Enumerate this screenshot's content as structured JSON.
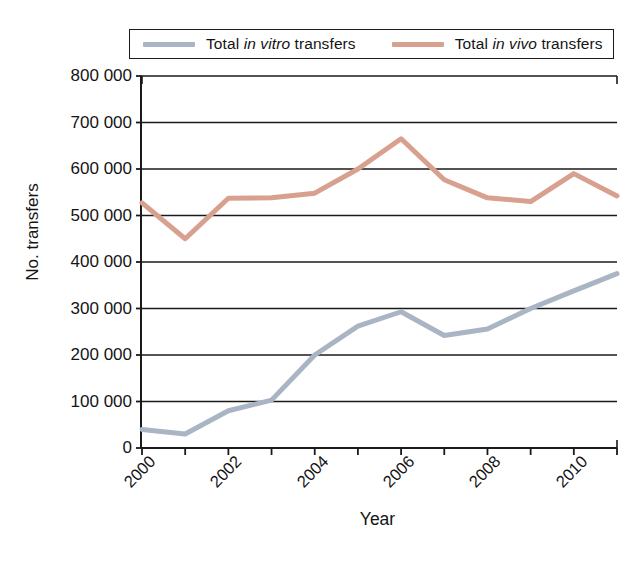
{
  "chart_data": {
    "type": "line",
    "title": "",
    "xlabel": "Year",
    "ylabel": "No. transfers",
    "x": [
      2000,
      2001,
      2002,
      2003,
      2004,
      2005,
      2006,
      2007,
      2008,
      2009,
      2010,
      2011
    ],
    "categories": [
      "2000",
      "2001",
      "2002",
      "2003",
      "2004",
      "2005",
      "2006",
      "2007",
      "2008",
      "2009",
      "2010",
      "2011"
    ],
    "series": [
      {
        "name": "Total in vitro transfers",
        "color": "#a9b5c4",
        "values": [
          40000,
          30000,
          80000,
          103000,
          200000,
          262000,
          293000,
          242000,
          256000,
          300000,
          338000,
          375000
        ]
      },
      {
        "name": "Total in vivo transfers",
        "color": "#d8a08e",
        "values": [
          527000,
          450000,
          537000,
          538000,
          548000,
          600000,
          665000,
          577000,
          538000,
          530000,
          590000,
          542000
        ]
      }
    ],
    "ylim": [
      0,
      800000
    ],
    "xlim": [
      2000,
      2011
    ],
    "ytick_values": [
      0,
      100000,
      200000,
      300000,
      400000,
      500000,
      600000,
      700000,
      800000
    ],
    "ytick_labels": [
      "0",
      "100 000",
      "200 000",
      "300 000",
      "400 000",
      "500 000",
      "600 000",
      "700 000",
      "800 000"
    ],
    "xtick_values": [
      2000,
      2001,
      2002,
      2003,
      2004,
      2005,
      2006,
      2007,
      2008,
      2009,
      2010,
      2011
    ],
    "xtick_labels_shown": [
      "2000",
      "",
      "2002",
      "",
      "2004",
      "",
      "2006",
      "",
      "2008",
      "",
      "2010",
      ""
    ],
    "grid": "horizontal",
    "legend_position": "top",
    "axis_color": "#1a1a1a",
    "background": "#ffffff"
  },
  "legend": {
    "entries": [
      {
        "id": "invitro",
        "prefix": "Total ",
        "italic": "in vitro",
        "suffix": " transfers",
        "color": "#a9b5c4"
      },
      {
        "id": "invivo",
        "prefix": "Total ",
        "italic": "in vivo",
        "suffix": " transfers",
        "color": "#d8a08e"
      }
    ]
  },
  "axes": {
    "y_title": "No. transfers",
    "x_title": "Year"
  }
}
